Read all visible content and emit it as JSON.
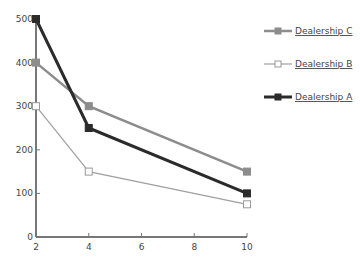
{
  "chart_data": {
    "type": "line",
    "title": "",
    "xlabel": "",
    "ylabel": "",
    "x": [
      2,
      4,
      10
    ],
    "xticks": [
      2,
      4,
      6,
      8,
      10
    ],
    "yticks": [
      0,
      100,
      200,
      300,
      400,
      500
    ],
    "xlim": [
      2,
      10
    ],
    "ylim": [
      0,
      500
    ],
    "grid": false,
    "legend_position": "right",
    "series": [
      {
        "name": "Dealership C",
        "values": [
          400,
          300,
          150
        ],
        "color": "#8c8c8c",
        "marker": "filled-square",
        "width": 2.5
      },
      {
        "name": "Dealership B",
        "values": [
          300,
          150,
          75
        ],
        "color": "#a0a0a0",
        "marker": "open-square",
        "width": 1.2
      },
      {
        "name": "Dealership A",
        "values": [
          500,
          250,
          100
        ],
        "color": "#2b2b2b",
        "marker": "filled-square-dark",
        "width": 3
      }
    ]
  }
}
